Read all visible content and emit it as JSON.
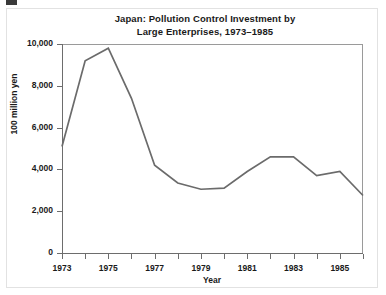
{
  "figure": {
    "title_line1": "Japan:  Pollution Control Investment by",
    "title_line2": "Large Enterprises, 1973–1985",
    "line_color": "#6b6b6b",
    "axis_color": "#6d6d6d",
    "frame_color": "#9a9a9a",
    "text_color": "#1a1a1a",
    "background": "#ffffff"
  },
  "chart_data": {
    "type": "line",
    "title": "Japan:  Pollution Control Investment by Large Enterprises, 1973–1985",
    "xlabel": "Year",
    "ylabel": "100 million yen",
    "xlim": [
      1973,
      1986
    ],
    "ylim": [
      0,
      10000
    ],
    "grid": false,
    "legend": false,
    "x": [
      1973,
      1974,
      1975,
      1976,
      1977,
      1978,
      1979,
      1980,
      1981,
      1982,
      1983,
      1984,
      1985,
      1986
    ],
    "values": [
      5100,
      9200,
      9800,
      7400,
      4200,
      3350,
      3050,
      3100,
      3900,
      4600,
      4600,
      3700,
      3900,
      2750
    ],
    "series": [
      {
        "name": "Pollution control investment",
        "values": [
          5100,
          9200,
          9800,
          7400,
          4200,
          3350,
          3050,
          3100,
          3900,
          4600,
          4600,
          3700,
          3900,
          2750
        ]
      }
    ],
    "y_ticks": [
      0,
      2000,
      4000,
      6000,
      8000,
      10000
    ],
    "y_tick_labels": [
      "0",
      "2,000",
      "4,000",
      "6,000",
      "8,000",
      "10,000"
    ],
    "x_ticks": [
      1973,
      1974,
      1975,
      1976,
      1977,
      1978,
      1979,
      1980,
      1981,
      1982,
      1983,
      1984,
      1985,
      1986
    ],
    "x_tick_labels": [
      "1973",
      "",
      "1975",
      "",
      "1977",
      "",
      "1979",
      "",
      "1981",
      "",
      "1983",
      "",
      "1985",
      ""
    ]
  }
}
